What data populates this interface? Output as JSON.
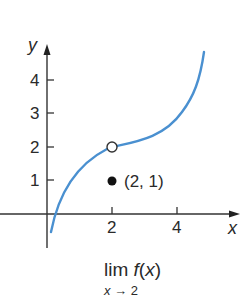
{
  "chart_data": {
    "type": "line",
    "title": "",
    "xlabel": "x",
    "ylabel": "y",
    "x_ticks": [
      "2",
      "4"
    ],
    "y_ticks": [
      "1",
      "2",
      "3",
      "4"
    ],
    "xlim": [
      -1.4,
      5.8
    ],
    "ylim": [
      -1,
      4.8
    ],
    "grid": false,
    "series": [
      {
        "name": "f(x)",
        "color": "#4a90d0",
        "x": [
          0.2,
          0.5,
          1.0,
          1.5,
          2.0,
          2.5,
          3.0,
          3.5,
          4.0,
          4.5
        ],
        "y": [
          -0.6,
          0.6,
          1.45,
          1.85,
          2.0,
          2.1,
          2.3,
          2.7,
          3.2,
          3.95
        ]
      }
    ],
    "open_point": {
      "x": 2,
      "y": 2
    },
    "closed_point": {
      "x": 2,
      "y": 1
    },
    "annotations": [
      {
        "text": "(2, 1)",
        "x": 2,
        "y": 1
      }
    ],
    "caption": "lim f(x), x → 2"
  },
  "labels": {
    "y_axis": "y",
    "x_axis": "x",
    "ytick_1": "1",
    "ytick_2": "2",
    "ytick_3": "3",
    "ytick_4": "4",
    "xtick_2": "2",
    "xtick_4": "4",
    "point_label": "(2, 1)",
    "caption_main": "lim f(x)",
    "caption_sub": "x → 2"
  }
}
